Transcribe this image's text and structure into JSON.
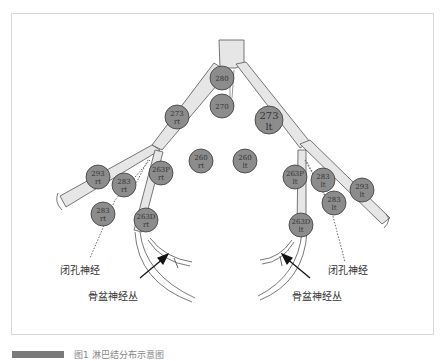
{
  "diagram": {
    "nodes": [
      {
        "id": "n280",
        "line1": "280",
        "line2": "",
        "cx": 222,
        "cy": 78,
        "r": 12
      },
      {
        "id": "n270",
        "line1": "270",
        "line2": "",
        "cx": 222,
        "cy": 106,
        "r": 12
      },
      {
        "id": "n273rt",
        "line1": "273",
        "line2": "rt",
        "cx": 177,
        "cy": 117,
        "r": 12
      },
      {
        "id": "n273lt",
        "line1": "273",
        "line2": "lt",
        "cx": 269,
        "cy": 120,
        "r": 14
      },
      {
        "id": "n260rt",
        "line1": "260",
        "line2": "rt",
        "cx": 201,
        "cy": 161,
        "r": 12
      },
      {
        "id": "n260lt",
        "line1": "260",
        "line2": "lt",
        "cx": 245,
        "cy": 161,
        "r": 12
      },
      {
        "id": "n293rt",
        "line1": "293",
        "line2": "rt",
        "cx": 98,
        "cy": 177,
        "r": 12
      },
      {
        "id": "n283rt_a",
        "line1": "283",
        "line2": "rt",
        "cx": 124,
        "cy": 185,
        "r": 12
      },
      {
        "id": "n263Prt",
        "line1": "263P",
        "line2": "rt",
        "cx": 161,
        "cy": 173,
        "r": 12
      },
      {
        "id": "n263Plt",
        "line1": "263P",
        "line2": "lt",
        "cx": 295,
        "cy": 177,
        "r": 12
      },
      {
        "id": "n283lt_a",
        "line1": "283",
        "line2": "lt",
        "cx": 323,
        "cy": 180,
        "r": 12
      },
      {
        "id": "n293lt",
        "line1": "293",
        "line2": "lt",
        "cx": 362,
        "cy": 190,
        "r": 12
      },
      {
        "id": "n283rt_b",
        "line1": "283",
        "line2": "rt",
        "cx": 103,
        "cy": 214,
        "r": 12
      },
      {
        "id": "n283lt_b",
        "line1": "283",
        "line2": "lt",
        "cx": 334,
        "cy": 203,
        "r": 12
      },
      {
        "id": "n263Drt",
        "line1": "263D",
        "line2": "rt",
        "cx": 146,
        "cy": 220,
        "r": 12
      },
      {
        "id": "n263Dlt",
        "line1": "263D",
        "line2": "lt",
        "cx": 301,
        "cy": 225,
        "r": 12
      }
    ],
    "labels": {
      "obturator_left": "闭孔神经",
      "obturator_right": "闭孔神经",
      "pelvic_plexus_left": "骨盆神经丛",
      "pelvic_plexus_right": "骨盆神经丛"
    },
    "colors": {
      "node_fill": "#8c8c8c",
      "node_stroke": "#3a3a3a",
      "vessel_fill": "#e6e6e6",
      "vessel_stroke": "#555555",
      "frame_border": "#d8d8d8"
    }
  },
  "caption": {
    "text": "图1  淋巴结分布示意图"
  }
}
